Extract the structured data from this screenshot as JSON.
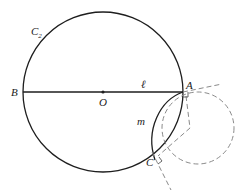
{
  "diagram": {
    "labels": {
      "circle": "C",
      "circle_subscript": "2",
      "B": "B",
      "O": "O",
      "line": "ℓ",
      "A": "A",
      "arc": "m",
      "C": "C"
    },
    "colors": {
      "solid": "#1e1e1e",
      "dashed": "#8a8a8a",
      "background": "#ffffff"
    },
    "geometry": {
      "main_circle": {
        "cx": 103,
        "cy": 92,
        "r": 80
      },
      "diameter": {
        "x1": 23,
        "y1": 92,
        "x2": 183,
        "y2": 92
      },
      "point_O": {
        "x": 103,
        "y": 92
      },
      "point_A": {
        "x": 183,
        "y": 92
      },
      "point_C": {
        "x": 155,
        "y": 160
      },
      "dashed_circle": {
        "cx": 198,
        "cy": 128,
        "r": 36
      },
      "kite_vertex": {
        "x": 190,
        "y": 128
      }
    }
  }
}
